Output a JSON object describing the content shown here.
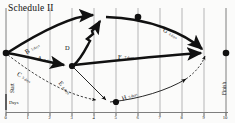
{
  "title": "Schedule II",
  "axis": {
    "label": "Days",
    "ticks": [
      "0",
      "1",
      "2",
      "3",
      "4",
      "5",
      "6",
      "7",
      "8",
      "9",
      "10"
    ],
    "min": 0,
    "max": 10,
    "gridlines": true
  },
  "endpoints": {
    "start_label": "Start",
    "finish_label": "Finish"
  },
  "colors": {
    "ink": "#111111",
    "critical": "#111111",
    "noncritical": "#333333",
    "grid": "#9a9a9a",
    "background": "#fbfbfa"
  },
  "nodes": [
    {
      "id": "start",
      "name": "Start",
      "day": 0,
      "y": 53
    },
    {
      "id": "n3",
      "name": "Node 3",
      "day": 3,
      "y": 66
    },
    {
      "id": "n6",
      "name": "Node 6",
      "day": 6,
      "y": 17
    },
    {
      "id": "n5",
      "name": "Node 5",
      "day": 5,
      "y": 102
    },
    {
      "id": "finish",
      "name": "Finish",
      "day": 10,
      "y": 53
    }
  ],
  "activities": [
    {
      "id": "A",
      "letter": "A",
      "duration": "3 days",
      "from": "start",
      "to": "n3",
      "style": "critical",
      "label_x": 38,
      "label_y": 52,
      "label_rot": 11,
      "days_dx": 7.0
    },
    {
      "id": "B",
      "letter": "B",
      "duration": "5 days",
      "from": "start",
      "to": "n6",
      "style": "critical",
      "label_x": 26,
      "label_y": 44,
      "label_rot": -38,
      "days_dx": 6.2
    },
    {
      "id": "C",
      "letter": "C",
      "duration": "5 days",
      "from": "start",
      "to": "n5",
      "style": "dashed",
      "label_x": 21,
      "label_y": 64,
      "label_rot": 34,
      "days_dx": 6.2
    },
    {
      "id": "D",
      "letter": "D",
      "duration": "4 days",
      "from": "n3",
      "to": "n6",
      "style": "critical",
      "label_x": 67,
      "label_y": 40,
      "label_rot": -55,
      "days_dx": 6.6
    },
    {
      "id": "E",
      "letter": "E",
      "duration": "4 days",
      "from": "n3",
      "to": "n5",
      "style": "thin",
      "label_x": 62,
      "label_y": 74,
      "label_rot": 53,
      "days_dx": 6.2
    },
    {
      "id": "F",
      "letter": "F",
      "duration": "7 days",
      "from": "n3",
      "to": "finish",
      "style": "critical",
      "label_x": 119,
      "label_y": 49,
      "label_rot": 0,
      "days_dx": 6.6
    },
    {
      "id": "G",
      "letter": "G",
      "duration": "4 days",
      "from": "n6",
      "to": "finish",
      "style": "critical",
      "label_x": 166,
      "label_y": 23,
      "label_rot": 32,
      "days_dx": 6.6
    },
    {
      "id": "H",
      "letter": "H",
      "duration": "5 days",
      "from": "n5",
      "to": "finish",
      "style": "thin",
      "label_x": 122,
      "label_y": 89,
      "label_rot": -23,
      "days_dx": 6.4
    }
  ]
}
